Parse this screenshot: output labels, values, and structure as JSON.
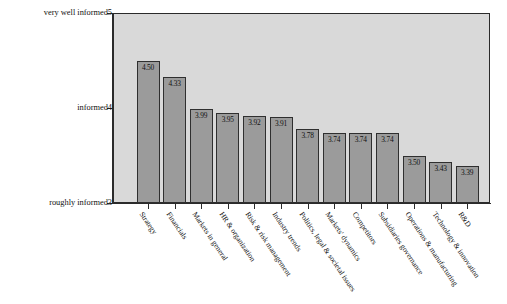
{
  "chart_data": {
    "type": "bar",
    "title": "",
    "subtitle": "",
    "xlabel": "",
    "ylabel": "",
    "ylim": [
      3,
      5
    ],
    "grid": false,
    "legend": "none",
    "orientation": "vertical",
    "categories": [
      "Strategy",
      "Financials",
      "Markets in general",
      "HR & organization",
      "Risk & risk management",
      "Industry trends",
      "Politics, legal & societal issues",
      "Markets' dynamics",
      "Competitors",
      "Subsidiaries governance",
      "Operations & manufacturing",
      "Technology & innovation",
      "R&D"
    ],
    "values": [
      4.5,
      4.33,
      3.99,
      3.95,
      3.92,
      3.91,
      3.78,
      3.74,
      3.74,
      3.74,
      3.5,
      3.43,
      3.39
    ],
    "value_labels": [
      "4.50",
      "4.33",
      "3.99",
      "3.95",
      "3.92",
      "3.91",
      "3.78",
      "3.74",
      "3.74",
      "3.74",
      "3.50",
      "3.43",
      "3.39"
    ],
    "y_axis": {
      "ticks": [
        {
          "value": 5,
          "number": "5",
          "label": "very well informed"
        },
        {
          "value": 4,
          "number": "4",
          "label": "informed"
        },
        {
          "value": 3,
          "number": "3",
          "label": "roughly informed"
        }
      ]
    },
    "colors": {
      "bar_fill": "#9b9b9b",
      "bar_border": "#2f2f2f",
      "plot_background": "#d9d9d9",
      "axis": "#2b2b2b",
      "text": "#111111",
      "page_background": "#ffffff"
    }
  }
}
